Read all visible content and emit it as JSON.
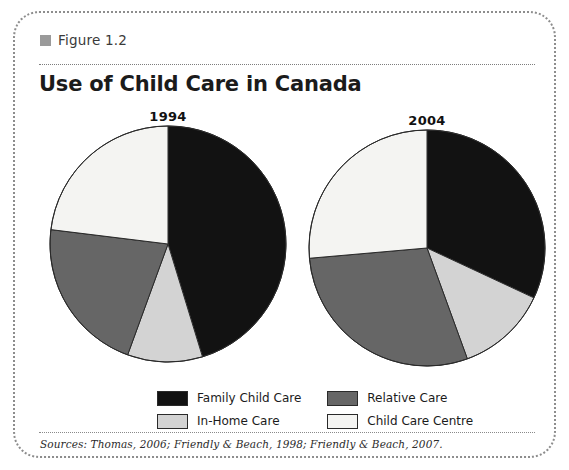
{
  "figure": {
    "label": "Figure 1.2",
    "title": "Use of Child Care in Canada",
    "sources": "Sources: Thomas, 2006; Friendly & Beach, 1998; Friendly & Beach, 2007."
  },
  "colors": {
    "family_child_care": "#121212",
    "in_home_care": "#d3d3d3",
    "relative_care": "#666666",
    "child_care_centre": "#f4f4f2",
    "outline": "#2a2a2a",
    "frame": "#8d8d8d",
    "figure_swatch": "#9a9a9a"
  },
  "legend": {
    "items": [
      {
        "label": "Family Child Care",
        "color": "#121212",
        "key": "family_child_care"
      },
      {
        "label": "Relative Care",
        "color": "#666666",
        "key": "relative_care"
      },
      {
        "label": "In-Home Care",
        "color": "#d3d3d3",
        "key": "in_home_care"
      },
      {
        "label": "Child Care Centre",
        "color": "#f4f4f2",
        "key": "child_care_centre"
      }
    ]
  },
  "chart_data": {
    "type": "pie",
    "title": "Use of Child Care in Canada",
    "xlabel": "",
    "ylabel": "",
    "legend_position": "bottom",
    "grid": false,
    "units": "percent",
    "categories": [
      "Family Child Care",
      "In-Home Care",
      "Relative Care",
      "Child Care Centre"
    ],
    "charts": [
      {
        "title": "1994",
        "start_angle_deg": 0,
        "direction": "clockwise",
        "slices": [
          {
            "label": "Family Child Care",
            "value": 45,
            "color": "#121212",
            "start_deg": 0,
            "end_deg": 163
          },
          {
            "label": "In-Home Care",
            "value": 10,
            "color": "#d3d3d3",
            "start_deg": 163,
            "end_deg": 200
          },
          {
            "label": "Relative Care",
            "value": 22,
            "color": "#666666",
            "start_deg": 200,
            "end_deg": 277
          },
          {
            "label": "Child Care Centre",
            "value": 23,
            "color": "#f4f4f2",
            "start_deg": 277,
            "end_deg": 360
          }
        ]
      },
      {
        "title": "2004",
        "start_angle_deg": 0,
        "direction": "clockwise",
        "slices": [
          {
            "label": "Family Child Care",
            "value": 32,
            "color": "#121212",
            "start_deg": 0,
            "end_deg": 115
          },
          {
            "label": "In-Home Care",
            "value": 12,
            "color": "#d3d3d3",
            "start_deg": 115,
            "end_deg": 160
          },
          {
            "label": "Relative Care",
            "value": 29,
            "color": "#666666",
            "start_deg": 160,
            "end_deg": 265
          },
          {
            "label": "Child Care Centre",
            "value": 27,
            "color": "#f4f4f2",
            "start_deg": 265,
            "end_deg": 360
          }
        ]
      }
    ]
  }
}
